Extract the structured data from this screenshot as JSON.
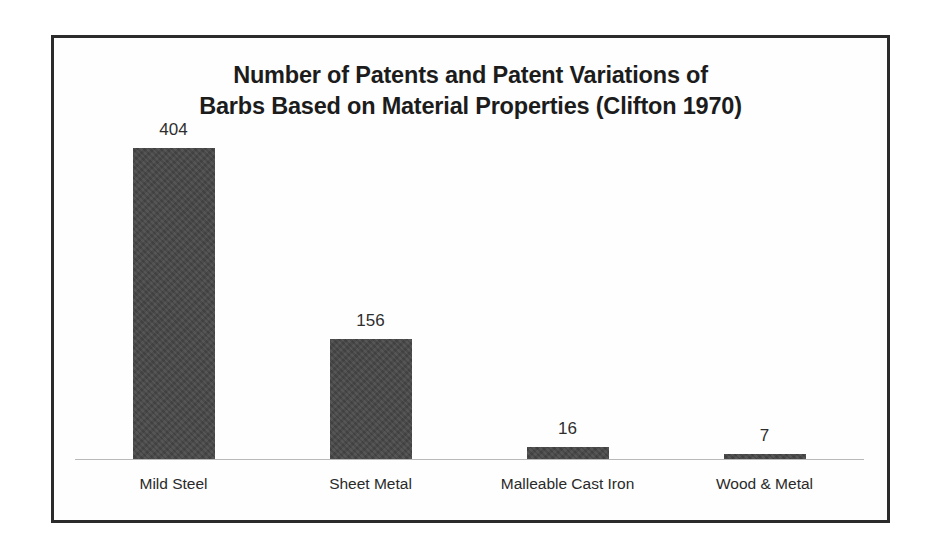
{
  "figure": {
    "border_color": "#2b2b2b",
    "background_color": "#ffffff"
  },
  "chart_data": {
    "type": "bar",
    "title": "Number of Patents and Patent Variations of Barbs Based on Material Properties (Clifton 1970)",
    "title_lines": [
      "Number of Patents and Patent Variations of",
      "Barbs Based on Material Properties (Clifton 1970)"
    ],
    "categories": [
      "Mild Steel",
      "Sheet Metal",
      "Malleable Cast Iron",
      "Wood & Metal"
    ],
    "values": [
      404,
      156,
      16,
      7
    ],
    "value_labels": [
      "404",
      "156",
      "16",
      "7"
    ],
    "xlabel": "",
    "ylabel": "",
    "ylim": [
      0,
      404
    ],
    "grid": false,
    "legend": false,
    "bar_color": "#474747",
    "axis_line_color": "#b9b9b9",
    "data_label_color": "#2e2e2e",
    "category_label_color": "#2a2a2a",
    "title_color": "#1c1c1c"
  }
}
